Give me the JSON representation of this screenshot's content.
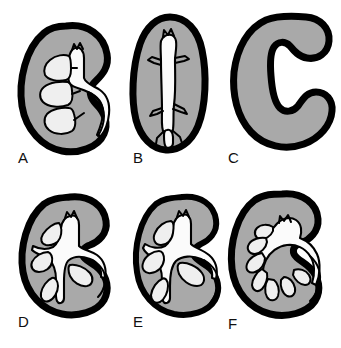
{
  "figure": {
    "width": 341,
    "height": 348,
    "background_color": "#ffffff",
    "rows": 2,
    "columns": 3
  },
  "colors": {
    "parenchyma_gray": "#a9a9a9",
    "outline_black": "#000000",
    "collecting_system_white": "#f2f2f2",
    "label_text": "#101010",
    "page_background": "#ffffff"
  },
  "panels": [
    {
      "id": "panel-a",
      "label": "A",
      "label_x": 18,
      "label_y": 158,
      "shape": "bean-shaped kidney with convex lateral border and hilar notch on right",
      "collecting_system": "three stacked calyces on left draining into a central renal pelvis with a ureter curving down and to the right",
      "calyx_count": 3
    },
    {
      "id": "panel-b",
      "label": "B",
      "label_x": 133,
      "label_y": 158,
      "shape": "tall oval kidney, narrower superiorly, no hilar notch",
      "collecting_system": "narrow vertical branching trunk with short lateral branches, like a slender tree",
      "calyx_count": 0
    },
    {
      "id": "panel-c",
      "label": "C",
      "label_x": 228,
      "label_y": 158,
      "shape": "thick C-shaped rim with a large open hilum facing right",
      "collecting_system": "no internal collecting system drawn; large white hilar space",
      "calyx_count": 0
    },
    {
      "id": "panel-d",
      "label": "D",
      "label_x": 18,
      "label_y": 333,
      "shape": "bean-shaped kidney with prominent upper pole hook and hilar notch on right",
      "collecting_system": "cross shaped renal pelvis with four angular calyceal compartments and a ureter exiting to the right",
      "calyx_count": 4
    },
    {
      "id": "panel-e",
      "label": "E",
      "label_x": 133,
      "label_y": 333,
      "shape": "bean-shaped kidney similar to D, slightly narrower",
      "collecting_system": "moderately dilated rounded calyces around a broad pelvis with ureter curving right and down",
      "calyx_count": 4
    },
    {
      "id": "panel-f",
      "label": "F",
      "label_x": 228,
      "label_y": 333,
      "shape": "bean-shaped kidney with large rounded lower pole",
      "collecting_system": "markedly dilated pelvis with a fan of radiating finger-like calyces and a wide curving ureter",
      "calyx_count": 7
    }
  ]
}
